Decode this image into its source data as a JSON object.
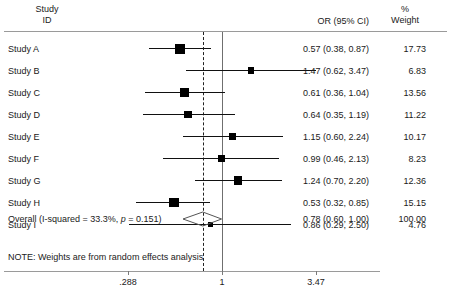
{
  "header": {
    "study_id_line1": "Study",
    "study_id_line2": "ID",
    "or_label": "OR (95% CI)",
    "weight_line1": "%",
    "weight_line2": "Weight"
  },
  "note": "NOTE: Weights are from random effects analysis",
  "overall": {
    "label_pre": "Overall (I-squared = 33.3%, ",
    "label_italic": "p",
    "label_post": " = 0.151)",
    "or_text": "0.78 (0.60, 1.00)",
    "weight": "100.00",
    "est": 0.78,
    "lo": 0.6,
    "hi": 1.0
  },
  "axis": {
    "ticks": [
      {
        "label": ".288",
        "value": 0.288
      },
      {
        "label": "1",
        "value": 1
      },
      {
        "label": "3.47",
        "value": 3.47
      }
    ],
    "min": 0.288,
    "max": 3.47,
    "null_value": 1,
    "scale": "log"
  },
  "colors": {
    "marker": "#000000",
    "line": "#111111",
    "rule": "#9a9a9a",
    "null_line": "#6f6f6f",
    "text": "#1a1a1a"
  },
  "chart_data": {
    "type": "forest",
    "title": "",
    "xlabel": "",
    "ylabel": "",
    "xlim": [
      0.288,
      3.47
    ],
    "scale": "log",
    "columns": [
      "Study ID",
      "OR (95% CI)",
      "% Weight"
    ],
    "studies": [
      {
        "label": "Study A",
        "est": 0.57,
        "lo": 0.38,
        "hi": 0.87,
        "or_text": "0.57 (0.38, 0.87)",
        "weight": 17.73,
        "weight_text": "17.73"
      },
      {
        "label": "Study B",
        "est": 1.47,
        "lo": 0.62,
        "hi": 3.47,
        "or_text": "1.47 (0.62, 3.47)",
        "weight": 6.83,
        "weight_text": "6.83"
      },
      {
        "label": "Study C",
        "est": 0.61,
        "lo": 0.36,
        "hi": 1.04,
        "or_text": "0.61 (0.36, 1.04)",
        "weight": 13.56,
        "weight_text": "13.56"
      },
      {
        "label": "Study D",
        "est": 0.64,
        "lo": 0.35,
        "hi": 1.19,
        "or_text": "0.64 (0.35, 1.19)",
        "weight": 11.22,
        "weight_text": "11.22"
      },
      {
        "label": "Study E",
        "est": 1.15,
        "lo": 0.6,
        "hi": 2.24,
        "or_text": "1.15 (0.60, 2.24)",
        "weight": 10.17,
        "weight_text": "10.17"
      },
      {
        "label": "Study F",
        "est": 0.99,
        "lo": 0.46,
        "hi": 2.13,
        "or_text": "0.99 (0.46, 2.13)",
        "weight": 8.23,
        "weight_text": "8.23"
      },
      {
        "label": "Study G",
        "est": 1.24,
        "lo": 0.7,
        "hi": 2.2,
        "or_text": "1.24 (0.70, 2.20)",
        "weight": 12.36,
        "weight_text": "12.36"
      },
      {
        "label": "Study H",
        "est": 0.53,
        "lo": 0.32,
        "hi": 0.85,
        "or_text": "0.53 (0.32, 0.85)",
        "weight": 15.15,
        "weight_text": "15.15"
      },
      {
        "label": "Study I",
        "est": 0.86,
        "lo": 0.29,
        "hi": 2.5,
        "or_text": "0.86 (0.29, 2.50)",
        "weight": 4.76,
        "weight_text": "4.76"
      }
    ],
    "overall": {
      "label": "Overall (I-squared = 33.3%, p = 0.151)",
      "est": 0.78,
      "lo": 0.6,
      "hi": 1.0,
      "or_text": "0.78 (0.60, 1.00)",
      "weight": 100.0,
      "weight_text": "100.00"
    },
    "heterogeneity": {
      "i_squared": "33.3%",
      "p_value": "0.151"
    },
    "note": "NOTE: Weights are from random effects analysis",
    "null_line": 1,
    "overall_line": 0.78
  }
}
